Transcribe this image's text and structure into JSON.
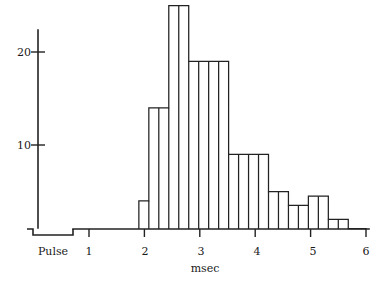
{
  "chart_data": {
    "type": "bar",
    "title": "",
    "subtitle": "",
    "xlabel": "msec",
    "ylabel": "",
    "xlim": [
      0.45,
      6.1
    ],
    "ylim": [
      0,
      25
    ],
    "grid": false,
    "legend": null,
    "bin_width": 0.1786,
    "x_tick_labels": [
      "1",
      "2",
      "3",
      "4",
      "5",
      "6"
    ],
    "x_tick_values": [
      1,
      2,
      3,
      4,
      5,
      6
    ],
    "y_tick_labels": [
      "10",
      "20"
    ],
    "y_tick_values": [
      10,
      20
    ],
    "annotations": [
      {
        "name": "pulse-marker",
        "label": "Pulse",
        "x_start": 0.55,
        "x_end": 1.28
      }
    ],
    "bins": [
      {
        "left": 1.9,
        "right": 2.08,
        "value": 4
      },
      {
        "left": 2.08,
        "right": 2.26,
        "value": 14
      },
      {
        "left": 2.26,
        "right": 2.44,
        "value": 14
      },
      {
        "left": 2.44,
        "right": 2.62,
        "value": 25
      },
      {
        "left": 2.62,
        "right": 2.8,
        "value": 25
      },
      {
        "left": 2.8,
        "right": 2.98,
        "value": 19
      },
      {
        "left": 2.98,
        "right": 3.16,
        "value": 19
      },
      {
        "left": 3.16,
        "right": 3.34,
        "value": 19
      },
      {
        "left": 3.34,
        "right": 3.52,
        "value": 19
      },
      {
        "left": 3.52,
        "right": 3.7,
        "value": 9
      },
      {
        "left": 3.7,
        "right": 3.88,
        "value": 9
      },
      {
        "left": 3.88,
        "right": 4.06,
        "value": 9
      },
      {
        "left": 4.06,
        "right": 4.24,
        "value": 9
      },
      {
        "left": 4.24,
        "right": 4.42,
        "value": 5
      },
      {
        "left": 4.42,
        "right": 4.6,
        "value": 5
      },
      {
        "left": 4.6,
        "right": 4.78,
        "value": 3.5
      },
      {
        "left": 4.78,
        "right": 4.96,
        "value": 3.5
      },
      {
        "left": 4.96,
        "right": 5.14,
        "value": 4.5
      },
      {
        "left": 5.14,
        "right": 5.32,
        "value": 4.5
      },
      {
        "left": 5.32,
        "right": 5.5,
        "value": 2
      },
      {
        "left": 5.5,
        "right": 5.68,
        "value": 2
      },
      {
        "left": 5.68,
        "right": 5.86,
        "value": 1
      },
      {
        "left": 5.86,
        "right": 6.0,
        "value": 1
      }
    ]
  },
  "axes": {
    "y_axis_name": "count-axis",
    "x_axis_name": "time-axis"
  }
}
